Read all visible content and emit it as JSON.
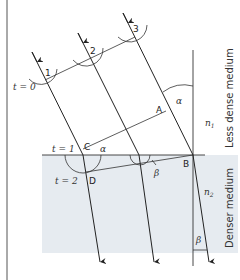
{
  "diagram": {
    "colors": {
      "line": "#222222",
      "denser_fill": "#e6ebf0",
      "background": "#ffffff"
    },
    "wavefront_points": [
      "1",
      "2",
      "3"
    ],
    "time_labels": {
      "t0": "t = 0",
      "t1": "t = 1",
      "t2": "t = 2"
    },
    "point_labels": {
      "A": "A",
      "B": "B",
      "C": "C",
      "D": "D"
    },
    "angle_labels": {
      "alpha": "α",
      "beta": "β"
    },
    "index_labels": {
      "n1": "n",
      "n1_sub": "1",
      "n2": "n",
      "n2_sub": "2"
    },
    "media": {
      "upper": "Less dense medium",
      "lower": "Denser medium"
    }
  }
}
